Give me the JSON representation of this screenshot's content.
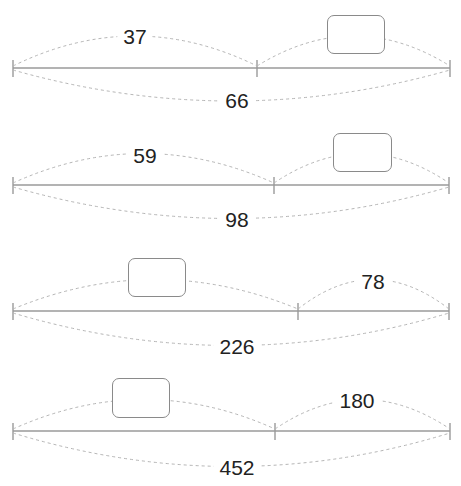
{
  "problems": [
    {
      "line_y": 68,
      "x_start": 13,
      "x_mid": 257,
      "x_end": 450,
      "top_left": {
        "type": "number",
        "value": "37",
        "x": 135,
        "y": 36
      },
      "top_right": {
        "type": "blank-box",
        "x": 327,
        "y": 15,
        "w": 58,
        "h": 39
      },
      "total": {
        "value": "66",
        "x": 237,
        "y": 100
      }
    },
    {
      "line_y": 185,
      "x_start": 13,
      "x_mid": 274,
      "x_end": 449,
      "top_left": {
        "type": "number",
        "value": "59",
        "x": 145,
        "y": 155
      },
      "top_right": {
        "type": "blank-box",
        "x": 333,
        "y": 133,
        "w": 59,
        "h": 39
      },
      "total": {
        "value": "98",
        "x": 237,
        "y": 219
      }
    },
    {
      "line_y": 311,
      "x_start": 13,
      "x_mid": 298,
      "x_end": 449,
      "top_left": {
        "type": "blank-box",
        "x": 128,
        "y": 258,
        "w": 58,
        "h": 39
      },
      "top_right": {
        "type": "number",
        "value": "78",
        "x": 373,
        "y": 281
      },
      "total": {
        "value": "226",
        "x": 237,
        "y": 346
      }
    },
    {
      "line_y": 431,
      "x_start": 13,
      "x_mid": 275,
      "x_end": 450,
      "top_left": {
        "type": "blank-box",
        "x": 112,
        "y": 378,
        "w": 58,
        "h": 40
      },
      "top_right": {
        "type": "number",
        "value": "180",
        "x": 357,
        "y": 400
      },
      "total": {
        "value": "452",
        "x": 237,
        "y": 467
      }
    }
  ],
  "colors": {
    "line": "#9a9a9a",
    "dash": "#b5b5b5",
    "text": "#222222",
    "box_border": "#8a8a8a"
  }
}
